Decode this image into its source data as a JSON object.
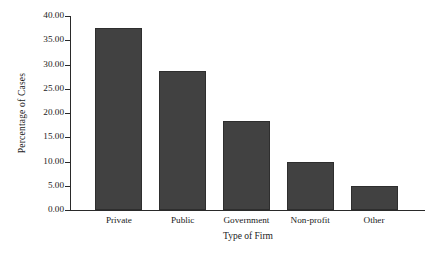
{
  "chart_data": {
    "type": "bar",
    "title": "",
    "xlabel": "Type of Firm",
    "ylabel": "Percentage of Cases",
    "categories": [
      "Private",
      "Public",
      "Government",
      "Non-profit",
      "Other"
    ],
    "values": [
      37.5,
      28.6,
      18.4,
      10.0,
      5.0
    ],
    "series": [
      {
        "name": "Percentage of Cases",
        "values": [
          37.5,
          28.6,
          18.4,
          10.0,
          5.0
        ]
      }
    ],
    "ylim": [
      0.0,
      40.0
    ],
    "ytick_step": 5.0,
    "ytick_labels": [
      "0.00",
      "5.00",
      "10.00",
      "15.00",
      "20.00",
      "25.00",
      "30.00",
      "35.00",
      "40.00"
    ],
    "ytick_values": [
      0,
      5,
      10,
      15,
      20,
      25,
      30,
      35,
      40
    ],
    "grid": false,
    "legend": false,
    "legend_position": "none",
    "bar_color": "#414141",
    "bar_edge_color": "#2e2e2e",
    "axis_color": "#2a2a2a",
    "background_color": "#ffffff"
  }
}
